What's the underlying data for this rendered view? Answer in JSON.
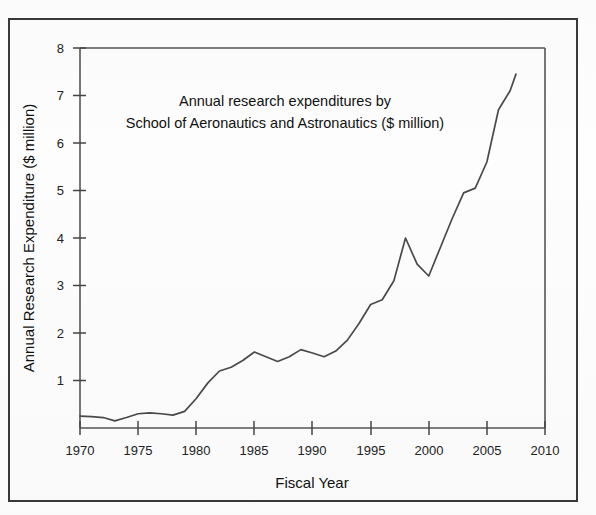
{
  "figure": {
    "background_color": "#fefefe",
    "frame_color": "#3a3a3a",
    "line_color": "#4a4a4a"
  },
  "chart_data": {
    "type": "line",
    "title_line1": "Annual research expenditures by",
    "title_line2": "School of Aeronautics and Astronautics ($ million)",
    "xlabel": "Fiscal Year",
    "ylabel": "Annual Research Expenditure ($ million)",
    "xlim": [
      1970,
      2010
    ],
    "ylim": [
      0,
      8
    ],
    "xticks": [
      1970,
      1975,
      1980,
      1985,
      1990,
      1995,
      2000,
      2005,
      2010
    ],
    "xtick_labels": [
      "1970",
      "1975",
      "1980",
      "1985",
      "1990",
      "1995",
      "2000",
      "2005",
      "2010"
    ],
    "yticks": [
      1,
      2,
      3,
      4,
      5,
      6,
      7,
      8
    ],
    "ytick_labels": [
      "1",
      "2",
      "3",
      "4",
      "5",
      "6",
      "7",
      "8"
    ],
    "grid": false,
    "legend": false,
    "series": [
      {
        "name": "Annual research expenditures",
        "x": [
          1970,
          1971,
          1972,
          1973,
          1974,
          1975,
          1976,
          1977,
          1978,
          1979,
          1980,
          1981,
          1982,
          1983,
          1984,
          1985,
          1986,
          1987,
          1988,
          1989,
          1990,
          1991,
          1992,
          1993,
          1994,
          1995,
          1996,
          1997,
          1998,
          1999,
          2000,
          2001,
          2002,
          2003,
          2004,
          2005,
          2006,
          2007,
          2007.5
        ],
        "values": [
          0.25,
          0.24,
          0.22,
          0.15,
          0.22,
          0.3,
          0.32,
          0.3,
          0.27,
          0.35,
          0.62,
          0.95,
          1.2,
          1.28,
          1.42,
          1.6,
          1.5,
          1.4,
          1.5,
          1.65,
          1.58,
          1.5,
          1.62,
          1.85,
          2.2,
          2.6,
          2.7,
          3.1,
          4.0,
          3.45,
          3.2,
          3.8,
          4.4,
          4.95,
          5.05,
          5.6,
          6.7,
          7.1,
          7.45
        ]
      }
    ]
  }
}
